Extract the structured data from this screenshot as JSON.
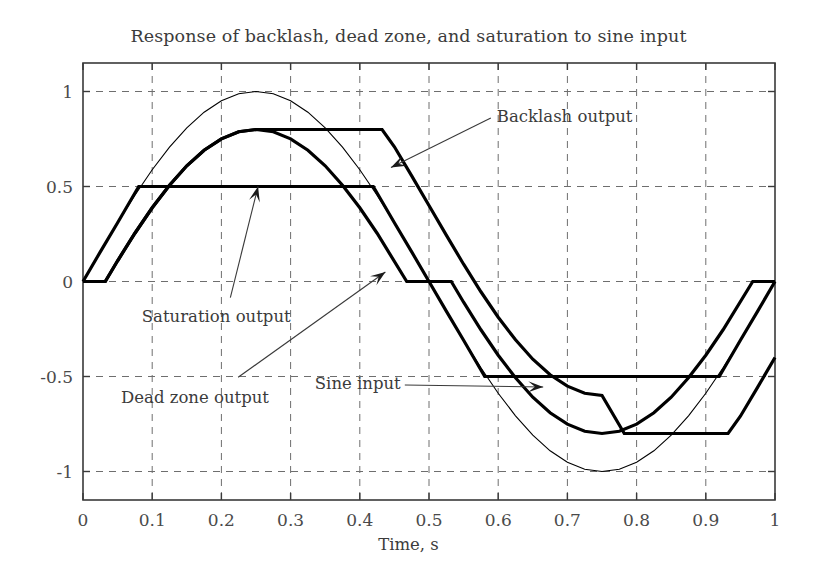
{
  "chart_data": {
    "type": "line",
    "title": "Response of backlash, dead zone, and saturation to sine input",
    "xlabel": "Time, s",
    "ylabel": "",
    "xlim": [
      0,
      1
    ],
    "ylim": [
      -1.15,
      1.15
    ],
    "grid": true,
    "legend_position": "inline-annotations",
    "xticks": [
      "0",
      "0.1",
      "0.2",
      "0.3",
      "0.4",
      "0.5",
      "0.6",
      "0.7",
      "0.8",
      "0.9",
      "1"
    ],
    "xtick_values": [
      0,
      0.1,
      0.2,
      0.3,
      0.4,
      0.5,
      0.6,
      0.7,
      0.8,
      0.9,
      1
    ],
    "yticks": [
      "1",
      "0.5",
      "0",
      "-0.5",
      "-1"
    ],
    "ytick_values": [
      1,
      0.5,
      0,
      -0.5,
      -1
    ],
    "series": [
      {
        "name": "Sine input",
        "style": "thin",
        "color": "#000000",
        "linewidth": 1.1,
        "description": "sin(2*pi*t), amplitude 1, period 1 s",
        "x": [
          0,
          0.025,
          0.05,
          0.075,
          0.1,
          0.125,
          0.15,
          0.175,
          0.2,
          0.225,
          0.25,
          0.275,
          0.3,
          0.325,
          0.35,
          0.375,
          0.4,
          0.425,
          0.45,
          0.475,
          0.5,
          0.525,
          0.55,
          0.575,
          0.6,
          0.625,
          0.65,
          0.675,
          0.7,
          0.725,
          0.75,
          0.775,
          0.8,
          0.825,
          0.85,
          0.875,
          0.9,
          0.925,
          0.95,
          0.975,
          1
        ],
        "y": [
          0,
          0.156,
          0.309,
          0.454,
          0.588,
          0.707,
          0.809,
          0.891,
          0.951,
          0.988,
          1,
          0.988,
          0.951,
          0.891,
          0.809,
          0.707,
          0.588,
          0.454,
          0.309,
          0.156,
          0,
          -0.156,
          -0.309,
          -0.454,
          -0.588,
          -0.707,
          -0.809,
          -0.891,
          -0.951,
          -0.988,
          -1,
          -0.988,
          -0.951,
          -0.891,
          -0.809,
          -0.707,
          -0.588,
          -0.454,
          -0.309,
          -0.156,
          0
        ]
      },
      {
        "name": "Saturation output",
        "style": "thick",
        "color": "#000000",
        "linewidth": 3.2,
        "description": "sine clipped at +/-0.5",
        "x": [
          0,
          0.025,
          0.05,
          0.0805,
          0.1,
          0.15,
          0.2,
          0.25,
          0.3,
          0.35,
          0.4,
          0.4195,
          0.45,
          0.475,
          0.5,
          0.525,
          0.55,
          0.5805,
          0.6,
          0.65,
          0.7,
          0.75,
          0.8,
          0.85,
          0.9,
          0.9195,
          0.95,
          0.975,
          1
        ],
        "y": [
          0,
          0.156,
          0.309,
          0.5,
          0.5,
          0.5,
          0.5,
          0.5,
          0.5,
          0.5,
          0.5,
          0.5,
          0.309,
          0.156,
          0,
          -0.156,
          -0.309,
          -0.5,
          -0.5,
          -0.5,
          -0.5,
          -0.5,
          -0.5,
          -0.5,
          -0.5,
          -0.5,
          -0.309,
          -0.156,
          0
        ]
      },
      {
        "name": "Dead zone output",
        "style": "thick",
        "color": "#000000",
        "linewidth": 3.2,
        "description": "sine with dead band of +/-0.2, output = sign(u)*(|u|-0.2) when |u|>0.2",
        "x": [
          0,
          0.0322,
          0.05,
          0.075,
          0.1,
          0.125,
          0.15,
          0.175,
          0.2,
          0.225,
          0.25,
          0.275,
          0.3,
          0.325,
          0.35,
          0.375,
          0.4,
          0.425,
          0.4678,
          0.5,
          0.5322,
          0.55,
          0.575,
          0.6,
          0.625,
          0.65,
          0.675,
          0.7,
          0.725,
          0.75,
          0.775,
          0.8,
          0.825,
          0.85,
          0.875,
          0.9,
          0.925,
          0.9678,
          1
        ],
        "y": [
          0,
          0,
          0.109,
          0.254,
          0.388,
          0.507,
          0.609,
          0.691,
          0.751,
          0.788,
          0.8,
          0.788,
          0.751,
          0.691,
          0.609,
          0.507,
          0.388,
          0.254,
          0,
          0,
          0,
          -0.109,
          -0.254,
          -0.388,
          -0.507,
          -0.609,
          -0.691,
          -0.751,
          -0.788,
          -0.8,
          -0.788,
          -0.751,
          -0.691,
          -0.609,
          -0.507,
          -0.388,
          -0.254,
          0,
          0
        ]
      },
      {
        "name": "Backlash output",
        "style": "thick",
        "color": "#000000",
        "linewidth": 3.2,
        "description": "sine through backlash with deadband width 0.4, output holds at extremes 0.8 and -0.8",
        "x": [
          0,
          0.0322,
          0.05,
          0.075,
          0.1,
          0.125,
          0.15,
          0.175,
          0.2,
          0.225,
          0.25,
          0.2822,
          0.3,
          0.35,
          0.4,
          0.4322,
          0.45,
          0.475,
          0.5,
          0.525,
          0.55,
          0.575,
          0.6,
          0.625,
          0.65,
          0.675,
          0.7,
          0.725,
          0.75,
          0.7822,
          0.8,
          0.85,
          0.9,
          0.9322,
          0.95,
          0.975,
          1
        ],
        "y": [
          0,
          0,
          0.109,
          0.254,
          0.388,
          0.507,
          0.609,
          0.691,
          0.751,
          0.788,
          0.8,
          0.8,
          0.8,
          0.8,
          0.8,
          0.8,
          0.709,
          0.556,
          0.4,
          0.244,
          0.091,
          -0.054,
          -0.188,
          -0.307,
          -0.409,
          -0.491,
          -0.551,
          -0.588,
          -0.6,
          -0.8,
          -0.8,
          -0.8,
          -0.8,
          -0.8,
          -0.709,
          -0.556,
          -0.4
        ]
      }
    ],
    "annotations": [
      {
        "id": "backlash",
        "label": "Backlash output",
        "text_x": 0.598,
        "text_y": 0.86,
        "arrow_tip_x": 0.445,
        "arrow_tip_y": 0.6
      },
      {
        "id": "saturation",
        "label": "Saturation output",
        "text_x": 0.085,
        "text_y": -0.19,
        "arrow_tip_x": 0.253,
        "arrow_tip_y": 0.5
      },
      {
        "id": "deadzone",
        "label": "Dead  zone output",
        "text_x": 0.055,
        "text_y": -0.62,
        "arrow_tip_x": 0.437,
        "arrow_tip_y": 0.05
      },
      {
        "id": "sine",
        "label": "Sine input",
        "text_x": 0.335,
        "text_y": -0.545,
        "arrow_tip_x": 0.665,
        "arrow_tip_y": -0.555
      }
    ]
  }
}
